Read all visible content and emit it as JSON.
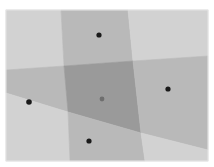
{
  "diagram": {
    "type": "voronoi-partition",
    "canvas": {
      "width": 214,
      "height": 167,
      "background": "#ffffff"
    },
    "frame": {
      "x": 6,
      "y": 10,
      "width": 202,
      "height": 151
    },
    "colors": {
      "corner": "#d2d2d2",
      "band": "#b9b9b9",
      "center": "#9a9a9a",
      "point": "#1a1a1a",
      "center_point": "#6e6e6e"
    },
    "regions": [
      {
        "name": "corner-top-left",
        "fill": "corner",
        "points": [
          [
            6,
            10
          ],
          [
            61,
            10
          ],
          [
            64,
            66
          ],
          [
            6,
            70
          ]
        ]
      },
      {
        "name": "band-top",
        "fill": "band",
        "points": [
          [
            61,
            10
          ],
          [
            128,
            10
          ],
          [
            133,
            61
          ],
          [
            64,
            66
          ]
        ]
      },
      {
        "name": "corner-top-right",
        "fill": "corner",
        "points": [
          [
            128,
            10
          ],
          [
            208,
            10
          ],
          [
            208,
            56
          ],
          [
            133,
            61
          ]
        ]
      },
      {
        "name": "band-left",
        "fill": "band",
        "points": [
          [
            6,
            70
          ],
          [
            64,
            66
          ],
          [
            68,
            112
          ],
          [
            6,
            93
          ]
        ]
      },
      {
        "name": "center-cell",
        "fill": "center",
        "points": [
          [
            64,
            66
          ],
          [
            133,
            61
          ],
          [
            141,
            133
          ],
          [
            68,
            112
          ]
        ]
      },
      {
        "name": "band-right",
        "fill": "band",
        "points": [
          [
            133,
            61
          ],
          [
            208,
            56
          ],
          [
            208,
            150
          ],
          [
            141,
            133
          ]
        ]
      },
      {
        "name": "corner-bottom-left",
        "fill": "corner",
        "points": [
          [
            6,
            93
          ],
          [
            68,
            112
          ],
          [
            70,
            161
          ],
          [
            6,
            161
          ]
        ]
      },
      {
        "name": "band-bottom",
        "fill": "band",
        "points": [
          [
            68,
            112
          ],
          [
            141,
            133
          ],
          [
            145,
            161
          ],
          [
            70,
            161
          ]
        ]
      },
      {
        "name": "corner-bottom-right",
        "fill": "corner",
        "points": [
          [
            141,
            133
          ],
          [
            208,
            150
          ],
          [
            208,
            161
          ],
          [
            145,
            161
          ]
        ]
      }
    ],
    "sites": [
      {
        "name": "site-top",
        "x": 99,
        "y": 35,
        "r": 2.6,
        "fill": "point"
      },
      {
        "name": "site-left",
        "x": 29,
        "y": 102,
        "r": 2.8,
        "fill": "point"
      },
      {
        "name": "site-center",
        "x": 102,
        "y": 99,
        "r": 2.4,
        "fill": "center_point"
      },
      {
        "name": "site-right",
        "x": 168,
        "y": 89,
        "r": 2.6,
        "fill": "point"
      },
      {
        "name": "site-bottom",
        "x": 89,
        "y": 141,
        "r": 2.6,
        "fill": "point"
      }
    ]
  }
}
